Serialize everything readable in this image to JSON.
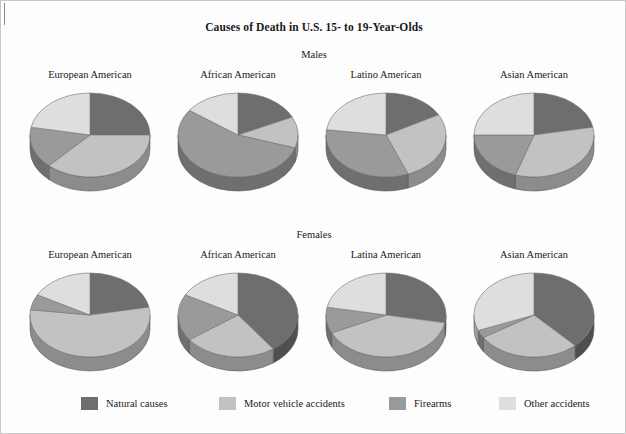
{
  "title": "Causes of Death in U.S. 15- to 19-Year-Olds",
  "rows": [
    {
      "key": "males",
      "label": "Males"
    },
    {
      "key": "females",
      "label": "Females"
    }
  ],
  "legend": [
    {
      "name": "natural-causes",
      "label": "Natural causes",
      "color": "#6e6e6e"
    },
    {
      "name": "motor-vehicle-accidents",
      "label": "Motor vehicle accidents",
      "color": "#c2c2c2"
    },
    {
      "name": "firearms",
      "label": "Firearms",
      "color": "#9a9a9a"
    },
    {
      "name": "other-accidents",
      "label": "Other accidents",
      "color": "#dedede"
    }
  ],
  "colors": {
    "natural_causes": "#6e6e6e",
    "motor_vehicle_accidents": "#c2c2c2",
    "firearms": "#9a9a9a",
    "other_accidents": "#dedede",
    "outline": "#707070",
    "background": "#fdfdfd",
    "frame": "#c8c8c8",
    "text": "#1a1a1a"
  },
  "panels": {
    "males": [
      {
        "label": "European American"
      },
      {
        "label": "African American"
      },
      {
        "label": "Latino American"
      },
      {
        "label": "Asian American"
      }
    ],
    "females": [
      {
        "label": "European American"
      },
      {
        "label": "African American"
      },
      {
        "label": "Latina American"
      },
      {
        "label": "Asian American"
      }
    ]
  },
  "chart_data": {
    "type": "pie",
    "title": "Causes of Death in U.S. 15- to 19-Year-Olds",
    "xlabel": "",
    "ylabel": "",
    "units": "percent of deaths",
    "legend_position": "bottom",
    "grid": false,
    "categories": [
      "Natural causes",
      "Motor vehicle accidents",
      "Firearms",
      "Other accidents"
    ],
    "slice_colors": [
      "#6e6e6e",
      "#c2c2c2",
      "#9a9a9a",
      "#dedede"
    ],
    "start_angle_deg": 0,
    "direction": "clockwise",
    "charts": [
      {
        "row": "Males",
        "group": "European American",
        "values": [
          25,
          37,
          16,
          22
        ]
      },
      {
        "row": "Males",
        "group": "African American",
        "values": [
          18,
          12,
          55,
          15
        ]
      },
      {
        "row": "Males",
        "group": "Latino American",
        "values": [
          17,
          27,
          33,
          23
        ]
      },
      {
        "row": "Males",
        "group": "Asian American",
        "values": [
          22,
          33,
          20,
          25
        ]
      },
      {
        "row": "Females",
        "group": "European American",
        "values": [
          22,
          55,
          6,
          17
        ]
      },
      {
        "row": "Females",
        "group": "African American",
        "values": [
          40,
          25,
          18,
          17
        ]
      },
      {
        "row": "Females",
        "group": "Latina American",
        "values": [
          28,
          40,
          10,
          22
        ]
      },
      {
        "row": "Females",
        "group": "Asian American",
        "values": [
          38,
          28,
          3,
          31
        ]
      }
    ]
  }
}
